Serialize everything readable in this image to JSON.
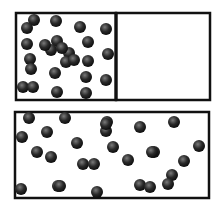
{
  "diagram": {
    "title": "",
    "top_container": {
      "label": "",
      "compartments": [
        "left-filled",
        "right-empty"
      ],
      "particle_count": 25
    },
    "bottom_container": {
      "label": "",
      "particle_count": 28
    },
    "colors": {
      "border": "#111111",
      "particle_dark": "#1a1a1a",
      "particle_light": "#777777",
      "background": "#ffffff"
    }
  }
}
